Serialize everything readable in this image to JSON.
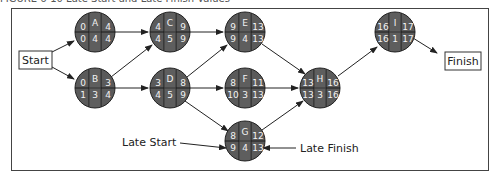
{
  "caption": "FIGURE 6-10  Late Start and Late Finish Values",
  "colors": {
    "node_fill": "#5a5a5a",
    "node_stroke": "#222222",
    "node_text": "#f2f2f2",
    "edge": "#222222",
    "box_stroke": "#333333"
  },
  "terminals": {
    "start": {
      "label": "Start"
    },
    "finish": {
      "label": "Finish"
    }
  },
  "nodes": {
    "A": {
      "name": "A",
      "es": "0",
      "ef": "4",
      "ls": "0",
      "dur": "4",
      "lf": "4"
    },
    "B": {
      "name": "B",
      "es": "0",
      "ef": "3",
      "ls": "1",
      "dur": "3",
      "lf": "4"
    },
    "C": {
      "name": "C",
      "es": "4",
      "ef": "9",
      "ls": "4",
      "dur": "5",
      "lf": "9"
    },
    "D": {
      "name": "D",
      "es": "3",
      "ef": "8",
      "ls": "4",
      "dur": "5",
      "lf": "9"
    },
    "E": {
      "name": "E",
      "es": "9",
      "ef": "13",
      "ls": "9",
      "dur": "4",
      "lf": "13"
    },
    "F": {
      "name": "F",
      "es": "8",
      "ef": "11",
      "ls": "10",
      "dur": "3",
      "lf": "13"
    },
    "G": {
      "name": "G",
      "es": "8",
      "ef": "12",
      "ls": "9",
      "dur": "4",
      "lf": "13"
    },
    "H": {
      "name": "H",
      "es": "13",
      "ef": "16",
      "ls": "13",
      "dur": "3",
      "lf": "16"
    },
    "I": {
      "name": "I",
      "es": "16",
      "ef": "17",
      "ls": "16",
      "dur": "1",
      "lf": "17"
    }
  },
  "edges": [
    [
      "Start",
      "A"
    ],
    [
      "Start",
      "B"
    ],
    [
      "A",
      "C"
    ],
    [
      "B",
      "C"
    ],
    [
      "B",
      "D"
    ],
    [
      "C",
      "E"
    ],
    [
      "D",
      "E"
    ],
    [
      "D",
      "F"
    ],
    [
      "D",
      "G"
    ],
    [
      "E",
      "H"
    ],
    [
      "F",
      "H"
    ],
    [
      "G",
      "H"
    ],
    [
      "H",
      "I"
    ],
    [
      "I",
      "Finish"
    ]
  ],
  "annotations": {
    "late_start": "Late Start",
    "late_finish": "Late Finish"
  }
}
